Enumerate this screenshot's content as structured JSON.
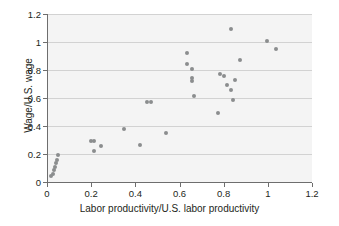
{
  "chart_data": {
    "type": "scatter",
    "title": "",
    "xlabel": "Labor productivity/U.S. labor productivity",
    "ylabel": "Wage/U.S. wage",
    "xlim": [
      0,
      1.2
    ],
    "ylim": [
      0,
      1.2
    ],
    "xticks": [
      "0",
      "0.2",
      "0.4",
      "0.6",
      "0.8",
      "1",
      "1.2"
    ],
    "xtick_values": [
      0,
      0.2,
      0.4,
      0.6,
      0.8,
      1.0,
      1.2
    ],
    "yticks": [
      "0",
      "0.2",
      "0.4",
      "0.6",
      "0.8",
      "1",
      "1.2"
    ],
    "ytick_values": [
      0,
      0.2,
      0.4,
      0.6,
      0.8,
      1.0,
      1.2
    ],
    "grid": "horizontal",
    "legend": "none",
    "marker_color": "#8b8d8e",
    "plot_background": "#f4f4f4",
    "points": [
      {
        "x": 0.02,
        "y": 0.04
      },
      {
        "x": 0.025,
        "y": 0.06
      },
      {
        "x": 0.03,
        "y": 0.085
      },
      {
        "x": 0.035,
        "y": 0.11
      },
      {
        "x": 0.04,
        "y": 0.135
      },
      {
        "x": 0.045,
        "y": 0.155
      },
      {
        "x": 0.05,
        "y": 0.19
      },
      {
        "x": 0.2,
        "y": 0.295
      },
      {
        "x": 0.215,
        "y": 0.295
      },
      {
        "x": 0.215,
        "y": 0.22
      },
      {
        "x": 0.245,
        "y": 0.26
      },
      {
        "x": 0.35,
        "y": 0.38
      },
      {
        "x": 0.42,
        "y": 0.265
      },
      {
        "x": 0.455,
        "y": 0.57
      },
      {
        "x": 0.47,
        "y": 0.57
      },
      {
        "x": 0.54,
        "y": 0.35
      },
      {
        "x": 0.635,
        "y": 0.92
      },
      {
        "x": 0.635,
        "y": 0.845
      },
      {
        "x": 0.655,
        "y": 0.81
      },
      {
        "x": 0.655,
        "y": 0.745
      },
      {
        "x": 0.655,
        "y": 0.72
      },
      {
        "x": 0.665,
        "y": 0.615
      },
      {
        "x": 0.775,
        "y": 0.495
      },
      {
        "x": 0.785,
        "y": 0.775
      },
      {
        "x": 0.8,
        "y": 0.755
      },
      {
        "x": 0.815,
        "y": 0.69
      },
      {
        "x": 0.835,
        "y": 1.09
      },
      {
        "x": 0.835,
        "y": 0.66
      },
      {
        "x": 0.84,
        "y": 0.585
      },
      {
        "x": 0.85,
        "y": 0.73
      },
      {
        "x": 0.875,
        "y": 0.87
      },
      {
        "x": 0.995,
        "y": 1.01
      },
      {
        "x": 1.035,
        "y": 0.95
      }
    ]
  }
}
